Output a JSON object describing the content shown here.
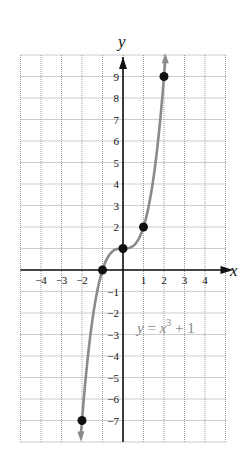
{
  "chart_data": {
    "type": "line",
    "title": "",
    "equation": "y = x^3 + 1",
    "xlabel": "x",
    "ylabel": "y",
    "xlim": [
      -5,
      5
    ],
    "ylim": [
      -8,
      10
    ],
    "grid": true,
    "x_ticks": [
      -4,
      -3,
      -2,
      1,
      2,
      3,
      4
    ],
    "y_ticks": [
      9,
      8,
      7,
      6,
      5,
      4,
      3,
      2,
      -1,
      -2,
      -3,
      -4,
      -5,
      -6,
      -7
    ],
    "series": [
      {
        "name": "y = x^3 + 1",
        "function": "x^3 + 1",
        "color": "#8a8a8a",
        "points": [
          {
            "x": -2,
            "y": -7
          },
          {
            "x": -1,
            "y": 0
          },
          {
            "x": 0,
            "y": 1
          },
          {
            "x": 1,
            "y": 2
          },
          {
            "x": 2,
            "y": 9
          }
        ]
      }
    ],
    "annotations": [
      {
        "text": "y = x³ + 1",
        "x": 1.9,
        "y": -2.9
      }
    ]
  },
  "labels": {
    "x_axis": "x",
    "y_axis": "y",
    "eq_y": "y",
    "eq_equals": " = ",
    "eq_x": "x",
    "eq_exp": "3",
    "eq_rest": " + 1"
  },
  "colors": {
    "axis": "#111111",
    "grid": "#9a9a9a",
    "curve": "#8a8a8a",
    "point": "#111111",
    "equation": "#8a8a8a"
  }
}
